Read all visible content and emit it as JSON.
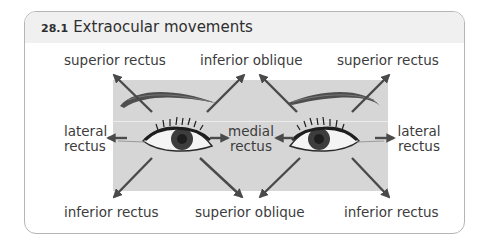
{
  "figure": {
    "number": "28.1",
    "title": "Extraocular movements"
  },
  "labels": {
    "top_left": "superior rectus",
    "top_center": "inferior oblique",
    "top_right": "superior rectus",
    "mid_left_1": "lateral",
    "mid_left_2": "rectus",
    "mid_center_1": "medial",
    "mid_center_2": "rectus",
    "mid_right_1": "lateral",
    "mid_right_2": "rectus",
    "bottom_left": "inferior rectus",
    "bottom_center": "superior oblique",
    "bottom_right": "inferior rectus"
  },
  "colors": {
    "panel": "#d6d6d6",
    "arrow": "#4a4a4a",
    "title_bar": "#f0f0f0",
    "iris": "#3d3d3d"
  }
}
